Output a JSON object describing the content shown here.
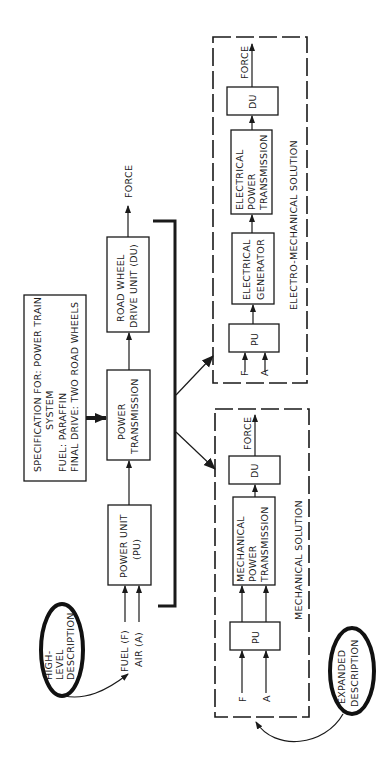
{
  "diagram": {
    "spec": {
      "line1": "SPECIFICATION FOR: POWER TRAIN",
      "line2": "SYSTEM",
      "line3": "FUEL: PARAFFIN",
      "line4": "FINAL DRIVE: TWO ROAD WHEELS"
    },
    "high_level": {
      "line1": "HIGH-",
      "line2": "LEVEL",
      "line3": "DESCRIPTION",
      "fuel": "FUEL (F)",
      "air": "AIR (A)",
      "pu_line1": "POWER UNIT",
      "pu_line2": "(PU)",
      "pt_line1": "POWER",
      "pt_line2": "TRANSMISSION",
      "du_line1": "ROAD WHEEL",
      "du_line2": "DRIVE UNIT (DU)",
      "force": "FORCE"
    },
    "electro_mechanical": {
      "title": "ELECTRO-MECHANICAL SOLUTION",
      "f": "F",
      "a": "A",
      "pu": "PU",
      "gen_line1": "ELECTRICAL",
      "gen_line2": "GENERATOR",
      "ept_line1": "ELECTRICAL",
      "ept_line2": "POWER",
      "ept_line3": "TRANSMISSION",
      "du": "DU",
      "force": "FORCE"
    },
    "mechanical": {
      "title": "MECHANICAL SOLUTION",
      "f": "F",
      "a": "A",
      "pu": "PU",
      "mpt_line1": "MECHANICAL",
      "mpt_line2": "POWER",
      "mpt_line3": "TRANSMISSION",
      "du": "DU",
      "force": "FORCE"
    },
    "expanded": {
      "line1": "EXPANDED",
      "line2": "DESCRIPTION"
    }
  }
}
